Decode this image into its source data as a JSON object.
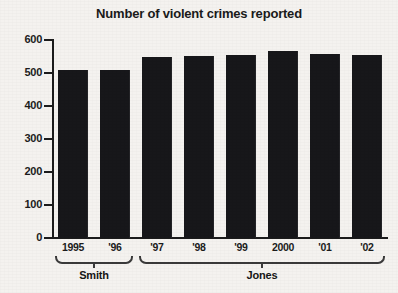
{
  "chart_data": {
    "type": "bar",
    "title": "Number of violent crimes reported",
    "xlabel": "",
    "ylabel": "",
    "categories": [
      "1995",
      "'96",
      "'97",
      "'98",
      "'99",
      "2000",
      "'01",
      "'02"
    ],
    "values": [
      508,
      510,
      549,
      552,
      554,
      566,
      557,
      555
    ],
    "ylim": [
      0,
      600
    ],
    "yticks": [
      0,
      100,
      200,
      300,
      400,
      500,
      600
    ],
    "ytick_labels": [
      "0",
      "100",
      "200",
      "300",
      "400",
      "500",
      "600"
    ],
    "grid": false,
    "legend": "none",
    "bar_color": "#17171a",
    "background_color": "#f4f2ef",
    "axis_color": "#1c1c1c",
    "groups": [
      {
        "label": "Smith",
        "categories": [
          "1995",
          "'96"
        ]
      },
      {
        "label": "Jones",
        "categories": [
          "'97",
          "'98",
          "'99",
          "2000",
          "'01",
          "'02"
        ]
      }
    ]
  },
  "chart": {
    "title": "Number of violent crimes reported",
    "y_ticks": [
      {
        "label": "600",
        "value": 600
      },
      {
        "label": "500",
        "value": 500
      },
      {
        "label": "400",
        "value": 400
      },
      {
        "label": "300",
        "value": 300
      },
      {
        "label": "200",
        "value": 200
      },
      {
        "label": "100",
        "value": 100
      },
      {
        "label": "0",
        "value": 0
      }
    ],
    "bars": [
      {
        "label": "1995",
        "value": 508
      },
      {
        "label": "'96",
        "value": 510
      },
      {
        "label": "'97",
        "value": 549
      },
      {
        "label": "'98",
        "value": 552
      },
      {
        "label": "'99",
        "value": 554
      },
      {
        "label": "2000",
        "value": 566
      },
      {
        "label": "'01",
        "value": 557
      },
      {
        "label": "'02",
        "value": 555
      }
    ],
    "groups": [
      {
        "label": "Smith",
        "start_index": 0,
        "end_index": 1
      },
      {
        "label": "Jones",
        "start_index": 2,
        "end_index": 7
      }
    ]
  }
}
